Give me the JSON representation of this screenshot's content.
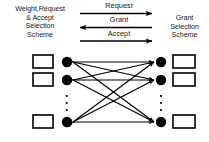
{
  "diagram": {
    "background_color": "#ffffff",
    "ink_color": "#000000",
    "text_color": "#1a1a1a",
    "left_scheme": {
      "label_lines": [
        "Weight,Request",
        "& Accept",
        "Selection",
        "Scheme"
      ],
      "label_text": "Weight,Request & Accept Selection Scheme"
    },
    "right_scheme": {
      "label_lines": [
        "Grant",
        "Selection",
        "Scheme"
      ],
      "label_text": "Grant Selection Scheme"
    },
    "messages": [
      {
        "label": "Request",
        "direction": "right"
      },
      {
        "label": "Grant",
        "direction": "left"
      },
      {
        "label": "Accept",
        "direction": "right"
      }
    ],
    "left_nodes": [
      {
        "id": "L1",
        "box": "input-queue-box",
        "dot": "input-port-node"
      },
      {
        "id": "L2",
        "box": "input-queue-box",
        "dot": "input-port-node"
      },
      {
        "id": "L3",
        "box": "input-queue-box",
        "dot": "input-port-node"
      }
    ],
    "right_nodes": [
      {
        "id": "R1",
        "box": "output-queue-box",
        "dot": "output-port-node"
      },
      {
        "id": "R2",
        "box": "output-queue-box",
        "dot": "output-port-node"
      },
      {
        "id": "R3",
        "box": "output-queue-box",
        "dot": "output-port-node"
      }
    ],
    "edges": [
      {
        "from": "L1",
        "to": "R1",
        "bidirectional": true
      },
      {
        "from": "L1",
        "to": "R2",
        "bidirectional": true
      },
      {
        "from": "L1",
        "to": "R3",
        "bidirectional": true
      },
      {
        "from": "L2",
        "to": "R1",
        "bidirectional": true
      },
      {
        "from": "L2",
        "to": "R2",
        "bidirectional": true
      },
      {
        "from": "L2",
        "to": "R3",
        "bidirectional": true
      },
      {
        "from": "L3",
        "to": "R1",
        "bidirectional": true
      },
      {
        "from": "L3",
        "to": "R2",
        "bidirectional": true
      },
      {
        "from": "L3",
        "to": "R3",
        "bidirectional": true
      }
    ],
    "ellipsis": {
      "left": "vertical-ellipsis",
      "right": "vertical-ellipsis",
      "dot_count": 3
    }
  }
}
